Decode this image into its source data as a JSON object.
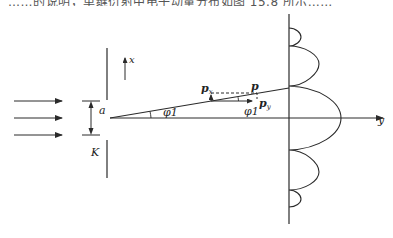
{
  "caption_fragment": "……的说明，单缝衍射中电子动量分布如图 15.8 所示……",
  "diagram": {
    "labels": {
      "slit_width": "a",
      "slit_label": "K",
      "x_axis": "x",
      "y_axis": "y",
      "angle_at_slit": "φ1",
      "angle_at_momentum": "φ1",
      "momentum": "p",
      "momentum_x": "px",
      "momentum_y": "py"
    },
    "incident_beams": 3,
    "colors": {
      "stroke": "#2a2a2a",
      "background": "#ffffff"
    }
  }
}
